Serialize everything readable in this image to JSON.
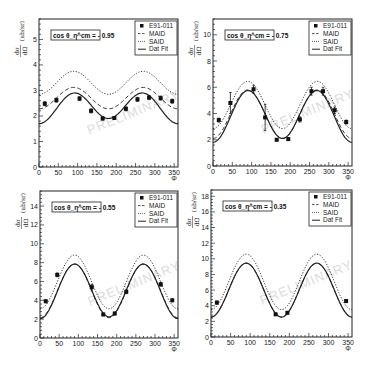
{
  "chart_data": [
    {
      "type": "scatter",
      "title": "cos θ_η^cm = - 0.95",
      "annotation": "cos θ_η^cm = - 0.95",
      "watermark": "PRELIMINARY",
      "xlabel": "Φ",
      "ylabel": "dσ/dΩ (ub/sr)",
      "xlim": [
        0,
        360
      ],
      "ylim": [
        0,
        5.8
      ],
      "xticks": [
        0,
        50,
        100,
        150,
        200,
        250,
        300,
        350
      ],
      "yticks": [
        0,
        1,
        2,
        3,
        4,
        5
      ],
      "legend": [
        "E91-011",
        "MAID",
        "SAID",
        "Dat Fit"
      ],
      "legend_position": "upper right",
      "grid": false,
      "points": {
        "name": "E91-011",
        "x": [
          15,
          45,
          105,
          135,
          165,
          195,
          225,
          255,
          285,
          315,
          345
        ],
        "y": [
          2.48,
          2.62,
          2.68,
          2.2,
          1.9,
          1.92,
          2.28,
          2.65,
          2.72,
          2.7,
          2.58
        ],
        "err": [
          0.08,
          0.08,
          0.08,
          0.08,
          0.06,
          0.06,
          0.08,
          0.08,
          0.08,
          0.08,
          0.08
        ]
      },
      "curves": [
        {
          "name": "MAID",
          "style": "dashed",
          "mean": 2.7,
          "a2": 0.42,
          "dip": 0.0
        },
        {
          "name": "SAID",
          "style": "dotted",
          "mean": 3.3,
          "a2": 0.45,
          "dip": 0.0
        },
        {
          "name": "Dat Fit",
          "style": "solid",
          "mean": 2.35,
          "a2": 0.55,
          "dip": 0.1
        }
      ]
    },
    {
      "type": "scatter",
      "title": "cos θ_η^cm = - 0.75",
      "annotation": "cos θ_η^cm = - 0.75",
      "watermark": "PRELIMINARY",
      "xlabel": "Φ",
      "ylabel": "dσ/dΩ (ub/sr)",
      "xlim": [
        0,
        360
      ],
      "ylim": [
        0,
        11.2
      ],
      "xticks": [
        0,
        50,
        100,
        150,
        200,
        250,
        300,
        350
      ],
      "yticks": [
        0,
        2,
        4,
        6,
        8,
        10
      ],
      "legend": [
        "E91-011",
        "MAID",
        "SAID",
        "Dat Fit"
      ],
      "legend_position": "upper right",
      "grid": false,
      "points": {
        "name": "E91-011",
        "x": [
          15,
          45,
          105,
          135,
          165,
          195,
          225,
          255,
          285,
          315,
          345
        ],
        "y": [
          3.5,
          4.8,
          5.85,
          3.7,
          2.0,
          2.05,
          3.55,
          5.7,
          5.7,
          4.25,
          3.35
        ],
        "err": [
          0.15,
          0.8,
          0.3,
          1.0,
          0.1,
          0.1,
          0.2,
          0.3,
          0.3,
          0.25,
          0.15
        ]
      },
      "curves": [
        {
          "name": "MAID",
          "style": "dashed",
          "mean": 3.95,
          "a2": 1.85,
          "dip": 0.0
        },
        {
          "name": "SAID",
          "style": "dotted",
          "mean": 4.65,
          "a2": 1.8,
          "dip": 0.0
        },
        {
          "name": "Dat Fit",
          "style": "solid",
          "mean": 3.85,
          "a2": 1.9,
          "dip": 0.15
        }
      ]
    },
    {
      "type": "scatter",
      "title": "cos θ_η^cm = - 0.55",
      "annotation": "cos θ_η^cm = - 0.55",
      "watermark": "PRELIMINARY",
      "xlabel": "Φ",
      "ylabel": "dσ/dΩ (ub/sr)",
      "xlim": [
        0,
        360
      ],
      "ylim": [
        0,
        15.6
      ],
      "xticks": [
        0,
        50,
        100,
        150,
        200,
        250,
        300,
        350
      ],
      "yticks": [
        0,
        2,
        4,
        6,
        8,
        10,
        12,
        14
      ],
      "legend": [
        "E91-011",
        "MAID",
        "SAID",
        "Dat Fit"
      ],
      "legend_position": "upper right",
      "grid": false,
      "points": {
        "name": "E91-011",
        "x": [
          15,
          45,
          135,
          165,
          195,
          225,
          315,
          345
        ],
        "y": [
          3.9,
          6.7,
          5.4,
          2.5,
          2.6,
          4.9,
          5.7,
          4.0
        ],
        "err": [
          0.15,
          0.2,
          0.3,
          0.15,
          0.15,
          0.2,
          0.2,
          0.15
        ]
      },
      "curves": [
        {
          "name": "MAID",
          "style": "dashed",
          "mean": 5.0,
          "a2": 2.85,
          "dip": 0.0
        },
        {
          "name": "SAID",
          "style": "dotted",
          "mean": 5.95,
          "a2": 2.85,
          "dip": 0.0
        },
        {
          "name": "Dat Fit",
          "style": "solid",
          "mean": 5.0,
          "a2": 2.85,
          "dip": 0.1
        }
      ]
    },
    {
      "type": "scatter",
      "title": "cos θ_η^cm = - 0.35",
      "annotation": "cos θ_η^cm = - 0.35",
      "watermark": "PRELIMINARY",
      "xlabel": "Φ",
      "ylabel": "dσ/dΩ (ub/sr)",
      "xlim": [
        0,
        360
      ],
      "ylim": [
        0,
        18.8
      ],
      "xticks": [
        0,
        50,
        100,
        150,
        200,
        250,
        300,
        350
      ],
      "yticks": [
        0,
        2,
        4,
        6,
        8,
        10,
        12,
        14,
        16,
        18
      ],
      "legend": [
        "E91-011",
        "MAID",
        "SAID",
        "Dat Fit"
      ],
      "legend_position": "upper right",
      "grid": false,
      "points": {
        "name": "E91-011",
        "x": [
          15,
          165,
          195,
          345
        ],
        "y": [
          4.4,
          2.9,
          3.1,
          4.6
        ],
        "err": [
          0.2,
          0.15,
          0.15,
          0.2
        ]
      },
      "curves": [
        {
          "name": "MAID",
          "style": "dashed",
          "mean": 6.0,
          "a2": 3.45,
          "dip": 0.0
        },
        {
          "name": "SAID",
          "style": "dotted",
          "mean": 7.05,
          "a2": 3.55,
          "dip": 0.0
        },
        {
          "name": "Dat Fit",
          "style": "solid",
          "mean": 6.0,
          "a2": 3.45,
          "dip": 0.0
        }
      ]
    }
  ],
  "panels_layout": [
    {
      "left": 39,
      "top": 19,
      "right": 178,
      "bottom": 167
    },
    {
      "left": 213,
      "top": 19,
      "right": 352,
      "bottom": 166
    },
    {
      "left": 40,
      "top": 191,
      "right": 178,
      "bottom": 338
    },
    {
      "left": 211,
      "top": 190,
      "right": 352,
      "bottom": 337
    }
  ],
  "labels": {
    "ylabel_num": "dσ",
    "ylabel_den": "dΩ",
    "ylabel_units": "(ub/sr)",
    "xlabel": "Φ"
  }
}
